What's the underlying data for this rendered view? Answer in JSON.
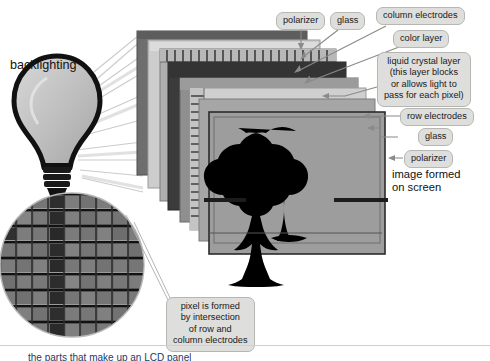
{
  "figure": {
    "type": "diagram",
    "background_color": "#ffffff",
    "callout_fill": "#dededc",
    "callout_border": "#b6b6b2",
    "arrow_color": "#8a8a88",
    "text_color": "#1a1a1a"
  },
  "titles": {
    "backlighting": "backlighting",
    "image_formed": "image formed\non screen"
  },
  "callouts": {
    "polarizer_top": "polarizer",
    "glass_top": "glass",
    "column_electrodes": "column electrodes",
    "color_layer": "color layer",
    "liquid_crystal_layer": "liquid crystal layer\n(this layer blocks\nor allows light to\npass for each pixel)",
    "row_electrodes": "row electrodes",
    "glass_bottom": "glass",
    "polarizer_bottom": "polarizer",
    "pixel_note": "pixel is formed\nby intersection\nof row and\ncolumn electrodes"
  },
  "bottom_caption": "the parts that make up an LCD panel",
  "layer_stack": [
    {
      "name": "polarizer",
      "shade": "#6e6e6e"
    },
    {
      "name": "glass",
      "shade": "#c9c9c9"
    },
    {
      "name": "column electrodes",
      "shade": "#a8a8a8"
    },
    {
      "name": "color layer",
      "shade": "#3a3a3a"
    },
    {
      "name": "liquid crystal layer",
      "shade": "#8f8f8f"
    },
    {
      "name": "row electrodes",
      "shade": "#cfcfcf"
    },
    {
      "name": "glass",
      "shade": "#9a9a9a"
    },
    {
      "name": "polarizer",
      "shade": "#8c8c8c"
    }
  ],
  "screen": {
    "image_subject": "tree silhouette",
    "image_color": "#000000",
    "screen_fill": "#9d9d9d"
  },
  "magnifier": {
    "shape": "circle",
    "cell_fill": "#777777",
    "cell_dark": "#2a2a2a",
    "grid_line": "#111111",
    "columns": 9,
    "rows": 9
  }
}
